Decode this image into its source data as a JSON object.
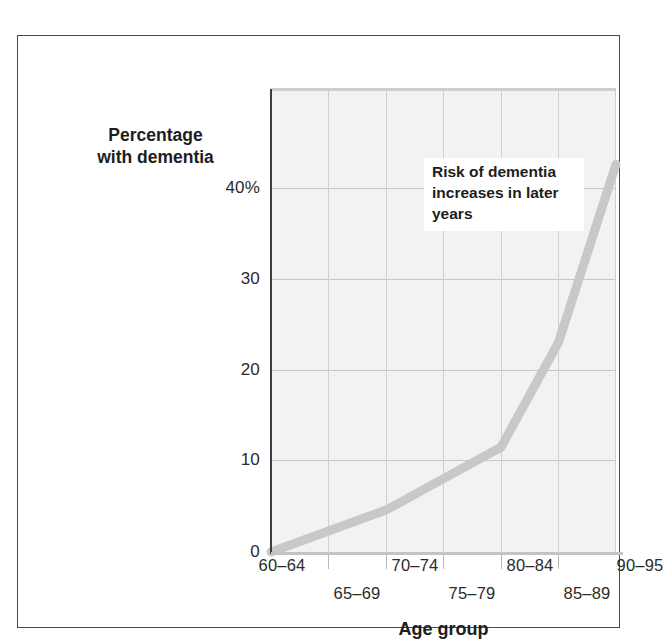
{
  "figure": {
    "background_color": "#ffffff",
    "frame_color": "#4a4a4a",
    "plot_background_color": "#f2f2f2",
    "grid_color": "#c6c6c6",
    "axis_color": "#3d3d3d"
  },
  "annotation": {
    "text": "Risk of dementia increases in later years",
    "line1": "Risk of dementia",
    "line2": "increases in later",
    "line3": "years"
  },
  "axes": {
    "y_title_line1": "Percentage",
    "y_title_line2": "with dementia",
    "x_title": "Age group"
  },
  "chart_data": {
    "type": "line",
    "title": "",
    "subtitle": "",
    "xlabel": "Age group",
    "ylabel": "Percentage with dementia",
    "categories": [
      "60–64",
      "65–69",
      "70–74",
      "75–79",
      "80–84",
      "85–89",
      "90–95"
    ],
    "values": [
      0,
      2,
      4,
      7,
      10,
      20,
      37
    ],
    "series": [
      {
        "name": "Percentage with dementia",
        "color": "#c8c8c8",
        "line_width": 9,
        "values": [
          0,
          2,
          4,
          7,
          10,
          20,
          37
        ]
      }
    ],
    "ylim": [
      0,
      44
    ],
    "y_ticks": [
      0,
      10,
      20,
      30,
      40
    ],
    "y_tick_labels": [
      "0",
      "10",
      "20",
      "30",
      "40%"
    ],
    "x_tick_labels_row_a": [
      "60–64",
      "70–74",
      "80–84",
      "90–95"
    ],
    "x_tick_labels_row_b": [
      "65–69",
      "75–79",
      "85–89"
    ],
    "grid": true,
    "grid_axes": "both",
    "legend": false,
    "legend_position": "none",
    "annotations": [
      {
        "text": "Risk of dementia increases in later years",
        "x_category": "80–84",
        "y_value": 36
      }
    ]
  },
  "y_ticks": [
    {
      "label": "40%",
      "value": 40
    },
    {
      "label": "30",
      "value": 30
    },
    {
      "label": "20",
      "value": 20
    },
    {
      "label": "10",
      "value": 10
    },
    {
      "label": "0",
      "value": 0
    }
  ],
  "x_ticks": [
    {
      "label": "60–64",
      "row": "a"
    },
    {
      "label": "65–69",
      "row": "b"
    },
    {
      "label": "70–74",
      "row": "a"
    },
    {
      "label": "75–79",
      "row": "b"
    },
    {
      "label": "80–84",
      "row": "a"
    },
    {
      "label": "85–89",
      "row": "b"
    },
    {
      "label": "90–95",
      "row": "a"
    }
  ]
}
